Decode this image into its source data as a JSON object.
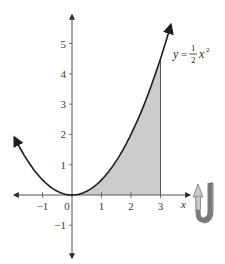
{
  "chart_data": {
    "type": "line",
    "title": "",
    "function": "y = 1/2 x^2",
    "curve_label": {
      "lhs": "y",
      "equals": "=",
      "num": "1",
      "den": "2",
      "var": "x",
      "exp": "2"
    },
    "xlabel": "x",
    "ylabel": "",
    "xlim": [
      -2,
      4
    ],
    "ylim": [
      -2,
      6
    ],
    "x_ticks": [
      -1,
      0,
      1,
      2,
      3
    ],
    "x_tick_labels": [
      "−1",
      "0",
      "1",
      "2",
      "3"
    ],
    "y_ticks": [
      -1,
      1,
      2,
      3,
      4,
      5
    ],
    "y_tick_labels": [
      "−1",
      "1",
      "2",
      "3",
      "4",
      "5"
    ],
    "series": [
      {
        "name": "y = 1/2 x^2",
        "x": [
          -2,
          -1.5,
          -1,
          -0.5,
          0,
          0.5,
          1,
          1.5,
          2,
          2.5,
          3,
          3.3
        ],
        "y": [
          2,
          1.125,
          0.5,
          0.125,
          0,
          0.125,
          0.5,
          1.125,
          2,
          3.125,
          4.5,
          5.445
        ]
      }
    ],
    "shaded_region": {
      "from_x": 0,
      "to_x": 3,
      "description": "Area under y = 1/2 x^2 from x = 0 to x = 3"
    },
    "grid": false,
    "legend": "none",
    "annotations": [
      "rotation arrow icon (revolution about x-axis)"
    ]
  },
  "colors": {
    "curve": "#1e1e1e",
    "axis": "#555555",
    "shade": "#cccccc",
    "rotation_arrow_light": "#c8c8c8",
    "rotation_arrow_dark": "#7a7a7a"
  }
}
